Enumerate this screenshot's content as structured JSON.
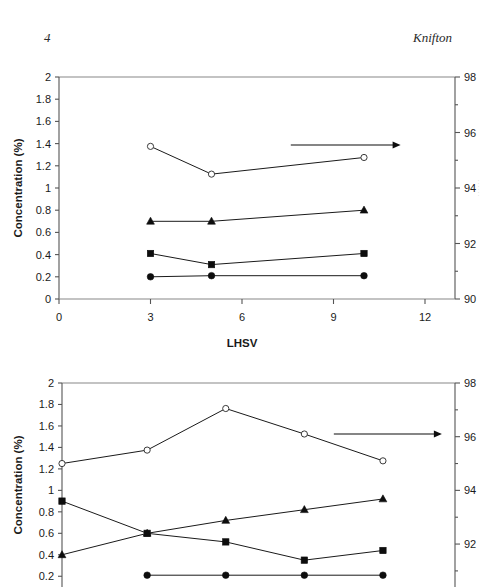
{
  "running_head": {
    "folio": "4",
    "author": "Knifton"
  },
  "chart_data": [
    {
      "id": "figure-top",
      "type": "line",
      "title": "",
      "xlabel": "LHSV",
      "ylabel": "Concentration (%)",
      "xlim": [
        0,
        12
      ],
      "xticks": [
        0,
        3,
        6,
        9,
        12
      ],
      "xticklabels": [
        "0",
        "3",
        "6",
        "9",
        "12"
      ],
      "ylim": [
        0,
        2
      ],
      "yticks": [
        0,
        0.2,
        0.4,
        0.6,
        0.8,
        1,
        1.2,
        1.4,
        1.6,
        1.8,
        2
      ],
      "yticklabels": [
        "0",
        "0.2",
        "0.4",
        "0.6",
        "0.8",
        "1",
        "1.2",
        "1.4",
        "1.6",
        "1.8",
        "2"
      ],
      "y2lim": [
        90,
        98
      ],
      "y2ticks": [
        90,
        92,
        94,
        96,
        98
      ],
      "y2ticklabels": [
        "90",
        "92",
        "94",
        "96",
        "98"
      ],
      "y2minorticks": [
        91,
        93,
        95,
        97
      ],
      "grid": false,
      "legend": "none",
      "annotations": [
        {
          "kind": "arrow",
          "from_x": 7.6,
          "from_y2": 95.55,
          "to_x": 11.2,
          "to_y2": 95.55,
          "note": "points to right axis"
        }
      ],
      "ghost_right_label": "secondary axis label (cropped, illegible)",
      "x": [
        3,
        5,
        10
      ],
      "series": [
        {
          "name": "open-circle-series",
          "marker": "open-circle",
          "axis": "right",
          "values": [
            95.5,
            94.5,
            95.1
          ],
          "left_equivalent": [
            1.5,
            1.25,
            1.39
          ]
        },
        {
          "name": "filled-triangle-series",
          "marker": "filled-triangle",
          "axis": "left",
          "values": [
            0.7,
            0.7,
            0.8
          ]
        },
        {
          "name": "filled-square-series",
          "marker": "filled-square",
          "axis": "left",
          "values": [
            0.41,
            0.31,
            0.41
          ]
        },
        {
          "name": "filled-circle-series",
          "marker": "filled-circle",
          "axis": "left",
          "values": [
            0.2,
            0.21,
            0.21
          ]
        }
      ]
    },
    {
      "id": "figure-bottom",
      "type": "line",
      "title": "",
      "xlabel": "",
      "ylabel": "Concentration (%)",
      "xlim": [
        0,
        12
      ],
      "xticks": [],
      "xticklabels": [],
      "ylim": [
        0.1,
        2
      ],
      "yticks": [
        0.2,
        0.4,
        0.6,
        0.8,
        1,
        1.2,
        1.4,
        1.6,
        1.8,
        2
      ],
      "yticklabels": [
        "0.2",
        "0.4",
        "0.6",
        "0.8",
        "1",
        "1.2",
        "1.4",
        "1.6",
        "1.8",
        "2"
      ],
      "y2lim": [
        90.4,
        98
      ],
      "y2ticks": [
        92,
        94,
        96,
        98
      ],
      "y2ticklabels": [
        "92",
        "94",
        "96",
        "98"
      ],
      "y2minorticks": [
        91,
        93,
        95,
        97
      ],
      "grid": false,
      "legend": "none",
      "cropped_bottom": true,
      "annotations": [
        {
          "kind": "arrow",
          "from_x": 8.3,
          "from_y2": 96.1,
          "to_x": 11.6,
          "to_y2": 96.1,
          "note": "points to right axis"
        }
      ],
      "x": [
        0,
        2.6,
        5.0,
        7.4,
        9.8
      ],
      "series": [
        {
          "name": "open-circle-series",
          "marker": "open-circle",
          "axis": "right",
          "values": [
            95.0,
            95.5,
            97.05,
            96.1,
            95.1
          ],
          "left_equivalent": [
            1.25,
            1.38,
            1.76,
            1.53,
            1.28
          ]
        },
        {
          "name": "filled-square-series",
          "marker": "filled-square",
          "axis": "left",
          "values": [
            0.9,
            0.6,
            0.52,
            0.35,
            0.44
          ]
        },
        {
          "name": "filled-triangle-series",
          "marker": "filled-triangle",
          "axis": "left",
          "values": [
            0.4,
            0.6,
            0.72,
            0.82,
            0.92
          ]
        },
        {
          "name": "filled-circle-series",
          "marker": "filled-circle",
          "axis": "left",
          "values": [
            null,
            0.21,
            0.21,
            0.21,
            0.21
          ]
        }
      ]
    }
  ]
}
